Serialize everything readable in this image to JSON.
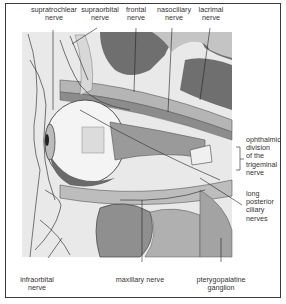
{
  "figure": {
    "labels": {
      "supratrochlear": [
        "supratrochlear",
        "nerve"
      ],
      "supraorbital": [
        "supraorbital",
        "nerve"
      ],
      "frontal": [
        "frontal",
        "nerve"
      ],
      "nasociliary": [
        "nasociliary",
        "nerve"
      ],
      "lacrimal": [
        "lacrimal",
        "nerve"
      ],
      "ophthalmic": [
        "ophthalmic",
        "division",
        "of the",
        "trigeminal",
        "nerve"
      ],
      "long_posterior_ciliary": [
        "long",
        "posterior",
        "ciliary",
        "nerves"
      ],
      "infraorbital": [
        "infraorbital",
        "nerve"
      ],
      "maxillary": [
        "maxillary nerve"
      ],
      "pterygopalatine": [
        "pterygopalatine",
        "ganglion"
      ]
    },
    "colors": {
      "frame": "#3a3a3a",
      "dark_tissue": "#6f6f6f",
      "mid_tissue": "#9a9a9a",
      "light_tissue": "#c9c9c9",
      "pale": "#e6e6e6",
      "line": "#3c3c3c"
    }
  }
}
